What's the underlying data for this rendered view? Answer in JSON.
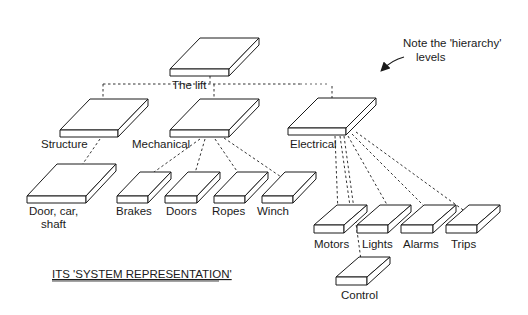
{
  "diagram": {
    "type": "hierarchy",
    "caption": "ITS 'SYSTEM REPRESENTATION'",
    "annotation": {
      "line1": "Note the 'hierarchy'",
      "line2": "levels"
    },
    "root": {
      "label": "The lift"
    },
    "level1": [
      {
        "label": "Structure"
      },
      {
        "label": "Mechanical"
      },
      {
        "label": "Electrical"
      }
    ],
    "level2": {
      "structure": [
        {
          "label_line1": "Door, car,",
          "label_line2": "shaft"
        }
      ],
      "mechanical": [
        {
          "label": "Brakes"
        },
        {
          "label": "Doors"
        },
        {
          "label": "Ropes"
        },
        {
          "label": "Winch"
        }
      ],
      "electrical": [
        {
          "label": "Motors"
        },
        {
          "label": "Lights"
        },
        {
          "label": "Alarms"
        },
        {
          "label": "Trips"
        },
        {
          "label": "Control"
        }
      ]
    },
    "edges": [
      [
        "The lift",
        "Structure"
      ],
      [
        "The lift",
        "Mechanical"
      ],
      [
        "The lift",
        "Electrical"
      ],
      [
        "Structure",
        "Door, car, shaft"
      ],
      [
        "Mechanical",
        "Brakes"
      ],
      [
        "Mechanical",
        "Doors"
      ],
      [
        "Mechanical",
        "Ropes"
      ],
      [
        "Mechanical",
        "Winch"
      ],
      [
        "Electrical",
        "Motors"
      ],
      [
        "Electrical",
        "Lights"
      ],
      [
        "Electrical",
        "Alarms"
      ],
      [
        "Electrical",
        "Trips"
      ],
      [
        "Electrical",
        "Control"
      ]
    ]
  }
}
